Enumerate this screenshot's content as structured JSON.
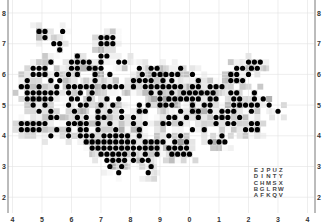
{
  "chart_data": {
    "type": "heatmap",
    "title": "",
    "x_tick_labels": [
      "4",
      "5",
      "6",
      "7",
      "8",
      "9",
      "0",
      "1",
      "2",
      "3",
      "4"
    ],
    "y_tick_labels": [
      "8",
      "7",
      "6",
      "5",
      "4",
      "3",
      "2"
    ],
    "xlim": [
      4,
      14
    ],
    "ylim": [
      1.5,
      8.4
    ],
    "grid": true,
    "cell_size": 0.2,
    "dot_color": "#000000",
    "heat_colors": [
      "#f4f4f4",
      "#e6e6e6",
      "#d2d2d2",
      "#b8b8b8",
      "#9c9c9c"
    ],
    "dot_rows": [
      {
        "y": 7.4,
        "x": [
          4.9,
          5.1,
          5.7
        ]
      },
      {
        "y": 7.2,
        "x": [
          5.1,
          7.0,
          7.2,
          7.4
        ]
      },
      {
        "y": 7.0,
        "x": [
          5.4,
          5.6,
          7.0,
          7.2,
          7.4
        ]
      },
      {
        "y": 6.8,
        "x": [
          5.6
        ]
      },
      {
        "y": 6.6,
        "x": [
          6.2,
          7.0,
          7.2
        ]
      },
      {
        "y": 6.4,
        "x": [
          5.3,
          6.0,
          6.2,
          6.4,
          6.6,
          7.0,
          7.6,
          7.8,
          12.0,
          12.2,
          12.4
        ]
      },
      {
        "y": 6.2,
        "x": [
          4.7,
          4.9,
          5.1,
          6.0,
          6.2,
          6.6,
          6.8,
          7.0,
          8.3,
          8.7,
          8.9,
          9.7,
          11.6,
          11.8,
          12.1,
          12.3
        ]
      },
      {
        "y": 6.0,
        "x": [
          4.7,
          4.9,
          5.1,
          5.5,
          5.9,
          6.2,
          6.8,
          7.3,
          8.4,
          8.8,
          9.0,
          9.2,
          9.4,
          9.6,
          10.1,
          11.4,
          11.6,
          12.0
        ]
      },
      {
        "y": 5.8,
        "x": [
          4.5,
          5.3,
          5.6,
          6.8,
          8.1,
          8.3,
          8.5,
          8.7,
          9.1,
          9.4,
          10.3,
          11.4,
          11.6,
          11.8
        ]
      },
      {
        "y": 5.6,
        "x": [
          4.3,
          4.5,
          4.9,
          5.5,
          5.9,
          6.1,
          6.3,
          6.5,
          6.7,
          7.1,
          7.3,
          7.5,
          7.7,
          8.1,
          8.5,
          8.7,
          8.9,
          9.1,
          9.3,
          9.5,
          9.7,
          10.1,
          10.3,
          10.7,
          10.9,
          11.1
        ]
      },
      {
        "y": 5.4,
        "x": [
          4.5,
          4.7,
          4.9,
          5.1,
          5.3,
          5.5,
          5.9,
          6.3,
          6.7,
          8.7,
          9.0,
          9.4,
          9.8,
          10.0,
          10.2,
          10.4,
          10.6,
          10.8,
          11.4,
          11.6,
          12.2
        ]
      },
      {
        "y": 5.2,
        "x": [
          4.5,
          4.7,
          4.9,
          5.1,
          5.3,
          6.0,
          6.2,
          6.6,
          7.2,
          7.6,
          9.0,
          9.3,
          9.5,
          9.7,
          9.9,
          10.1,
          10.3,
          10.7,
          10.9,
          11.5,
          11.7,
          12.2,
          12.5
        ]
      },
      {
        "y": 5.0,
        "x": [
          4.7,
          5.1,
          5.9,
          6.3,
          6.5,
          7.0,
          7.4,
          8.3,
          8.6,
          9.0,
          9.2,
          9.4,
          10.1,
          10.5,
          10.7,
          11.5,
          11.7,
          11.9,
          12.1,
          12.3,
          12.7
        ]
      },
      {
        "y": 4.8,
        "x": [
          4.9,
          5.3,
          6.1,
          6.9,
          7.3,
          7.7,
          8.3,
          8.5,
          9.7,
          10.1,
          10.3,
          10.7,
          11.1,
          11.3,
          11.5,
          12.1,
          13.0
        ]
      },
      {
        "y": 4.6,
        "x": [
          5.3,
          5.5,
          6.2,
          6.5,
          6.9,
          7.1,
          7.7,
          8.1,
          9.3,
          9.5,
          9.9,
          10.3,
          10.9,
          11.1,
          11.3,
          11.7
        ]
      },
      {
        "y": 4.4,
        "x": [
          4.3,
          4.5,
          4.7,
          4.9,
          5.1,
          5.9,
          6.1,
          6.3,
          6.5,
          6.9,
          7.3,
          8.1,
          8.5,
          9.1,
          9.3,
          9.7,
          10.9,
          11.3,
          11.5,
          12.1,
          12.3
        ]
      },
      {
        "y": 4.2,
        "x": [
          4.3,
          4.5,
          4.7,
          4.9,
          5.5,
          5.9,
          6.3,
          6.5,
          6.9,
          7.5,
          8.3,
          10.1,
          10.5,
          11.9,
          12.1,
          12.3
        ]
      },
      {
        "y": 4.0,
        "x": [
          5.3,
          5.9,
          6.3,
          6.5,
          6.7,
          7.1,
          7.3,
          7.5,
          7.7,
          7.9,
          8.3,
          9.3,
          9.7,
          11.1
        ]
      },
      {
        "y": 3.8,
        "x": [
          6.5,
          6.7,
          6.9,
          7.1,
          7.3,
          7.5,
          7.7,
          7.9,
          8.1,
          8.5,
          8.7,
          8.9,
          9.1,
          9.5,
          9.9,
          10.7,
          11.0,
          11.2
        ]
      },
      {
        "y": 3.6,
        "x": [
          6.7,
          6.9,
          7.1,
          7.3,
          7.5,
          7.7,
          7.9,
          8.1,
          8.3,
          8.5,
          8.7,
          8.9,
          9.3,
          9.5,
          9.7,
          9.9
        ]
      },
      {
        "y": 3.4,
        "x": [
          7.0,
          7.2,
          7.4,
          7.6,
          7.8,
          8.1,
          8.5,
          8.9,
          9.4,
          9.6,
          9.8,
          10.0
        ]
      },
      {
        "y": 3.2,
        "x": [
          7.2,
          7.4,
          7.6,
          7.8,
          8.1,
          8.4,
          8.6
        ]
      },
      {
        "y": 3.0,
        "x": [
          7.3,
          7.7,
          8.7
        ]
      },
      {
        "y": 2.8,
        "x": [
          7.6,
          8.6
        ]
      }
    ],
    "letter_grid": [
      [
        "E",
        "J",
        "P",
        "U",
        "Z"
      ],
      [
        "D",
        "I",
        "N",
        "T",
        "Y"
      ],
      [
        "C",
        "H",
        "M",
        "S",
        "X"
      ],
      [
        "B",
        "G",
        "L",
        "R",
        "W"
      ],
      [
        "A",
        "F",
        "K",
        "Q",
        "V"
      ]
    ]
  }
}
